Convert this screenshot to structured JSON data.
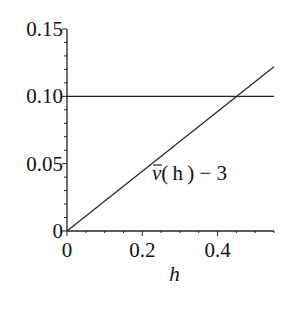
{
  "chart_data": {
    "type": "line",
    "title": "",
    "xlabel": "h",
    "ylabel": "",
    "xlim": [
      0,
      0.55
    ],
    "ylim": [
      0,
      0.15
    ],
    "grid": false,
    "legend": null,
    "x_ticks": [
      0,
      0.2,
      0.4
    ],
    "x_tick_labels": [
      "0",
      "0.2",
      "0.4"
    ],
    "y_ticks": [
      0,
      0.05,
      0.1,
      0.15
    ],
    "y_tick_labels": [
      "0",
      "0.05",
      "0.10",
      "0.15"
    ],
    "series": [
      {
        "name": "v̄(h) − 3",
        "x": [
          0,
          0.55
        ],
        "y": [
          0,
          0.122
        ]
      },
      {
        "name": "y = 0.10",
        "x": [
          0,
          0.55
        ],
        "y": [
          0.1,
          0.1
        ]
      }
    ],
    "annotations": [
      {
        "text_main": "v",
        "text_rest": "(h) − 3",
        "x": 0.22,
        "y": 0.045
      }
    ]
  }
}
